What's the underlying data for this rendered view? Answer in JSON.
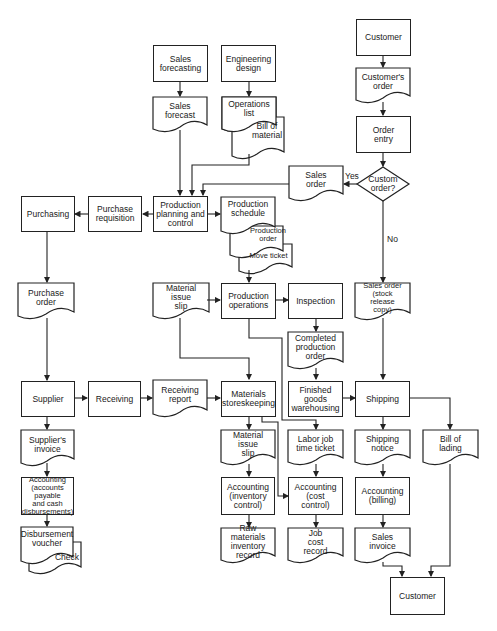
{
  "diagram": {
    "title": "",
    "nodes": {
      "sales_forecasting": "Sales\nforecasting",
      "engineering_design": "Engineering\ndesign",
      "customer_top": "Customer",
      "sales_forecast": "Sales\nforecast",
      "operations_list": "Operations\nlist",
      "bill_of_material": "Bill of\nmaterial",
      "customers_order": "Customer's\norder",
      "order_entry": "Order\nentry",
      "custom_order": "Custom\norder?",
      "sales_order": "Sales\norder",
      "purchasing": "Purchasing",
      "purchase_requisition": "Purchase\nrequisition",
      "production_planning": "Production\nplanning and\ncontrol",
      "production_schedule": "Production\nschedule",
      "production_order": "Production\norder",
      "move_ticket": "Move ticket",
      "purchase_order": "Purchase\norder",
      "material_issue_slip_1": "Material\nissue\nslip",
      "production_operations": "Production\noperations",
      "inspection": "Inspection",
      "sales_order_stock": "Sales order\n(stock\nrelease\ncopy)",
      "completed_production_order": "Completed\nproduction\norder",
      "supplier": "Supplier",
      "receiving": "Receiving",
      "receiving_report": "Receiving\nreport",
      "materials_storeskeeping": "Materials\nstoreskeeping",
      "finished_goods": "Finished\ngoods\nwarehousing",
      "shipping": "Shipping",
      "suppliers_invoice": "Supplier's\ninvoice",
      "material_issue_slip_2": "Material\nissue\nslip",
      "labor_job_time_ticket": "Labor job\ntime ticket",
      "shipping_notice": "Shipping\nnotice",
      "bill_of_lading": "Bill of\nlading",
      "accounting_ap": "Accounting\n(accounts\npayable\nand cash\ndisbursements)",
      "accounting_inventory": "Accounting\n(inventory\ncontrol)",
      "accounting_cost": "Accounting\n(cost\ncontrol)",
      "accounting_billing": "Accounting\n(billing)",
      "disbursement_voucher": "Disbursement\nvoucher",
      "check": "Check",
      "raw_materials_record": "Raw materials\ninventory\nrecord",
      "job_cost_record": "Job\ncost\nrecord",
      "sales_invoice": "Sales\ninvoice",
      "customer_bottom": "Customer"
    },
    "edge_labels": {
      "yes": "Yes",
      "no": "No"
    },
    "colors": {
      "line": "#222222",
      "background": "#ffffff"
    }
  }
}
